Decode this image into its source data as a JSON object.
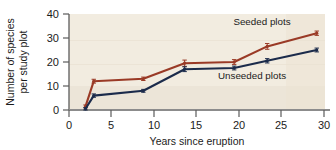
{
  "chart_data": {
    "type": "line",
    "title": "",
    "xlabel": "Years since eruption",
    "ylabel": "Number of species per study plot",
    "ylabel_line1": "Number of species",
    "ylabel_line2": "per study plot",
    "xlim": [
      0,
      31
    ],
    "ylim": [
      0,
      40
    ],
    "xticks": [
      0,
      5,
      10,
      15,
      20,
      25,
      30
    ],
    "xtick_labels": [
      "0",
      "5",
      "10",
      "15",
      "20",
      "25",
      "30"
    ],
    "yticks": [
      0,
      10,
      20,
      30,
      40
    ],
    "ytick_labels": [
      "0",
      "10",
      "20",
      "30",
      "40"
    ],
    "grid": false,
    "legend_position": "inline-annotation",
    "plot_background": "#f2ece0",
    "series": [
      {
        "name": "Seeded plots",
        "color": "#9a3a26",
        "x": [
          2,
          3,
          9,
          14,
          20,
          24,
          30
        ],
        "values": [
          1.5,
          12,
          13,
          19.5,
          20,
          26.5,
          32
        ],
        "error": [
          0.6,
          0.8,
          0.7,
          1.3,
          1.0,
          1.2,
          0.9
        ],
        "label_x": 24,
        "label_y": 36.5
      },
      {
        "name": "Unseeded plots",
        "color": "#1b2b4b",
        "x": [
          2,
          3,
          9,
          14,
          20,
          24,
          30
        ],
        "values": [
          0.5,
          6,
          8,
          17,
          17.5,
          20.5,
          25
        ],
        "error": [
          0.5,
          0.7,
          0.6,
          1.0,
          0.8,
          0.9,
          0.8
        ],
        "label_x": 22.5,
        "label_y": 14.2
      }
    ],
    "annotations": [
      {
        "text": "Seeded plots",
        "x": 24,
        "y": 36.5
      },
      {
        "text": "Unseeded plots",
        "x": 22.5,
        "y": 14.2
      }
    ]
  },
  "labels": {
    "y_axis_line1": "Number of species",
    "y_axis_line2": "per study plot",
    "x_axis": "Years since eruption",
    "seeded": "Seeded plots",
    "unseeded": "Unseeded plots",
    "ytick_0": "0",
    "ytick_10": "10",
    "ytick_20": "20",
    "ytick_30": "30",
    "ytick_40": "40",
    "xtick_0": "0",
    "xtick_5": "5",
    "xtick_10": "10",
    "xtick_15": "15",
    "xtick_20": "20",
    "xtick_25": "25",
    "xtick_30": "30"
  }
}
